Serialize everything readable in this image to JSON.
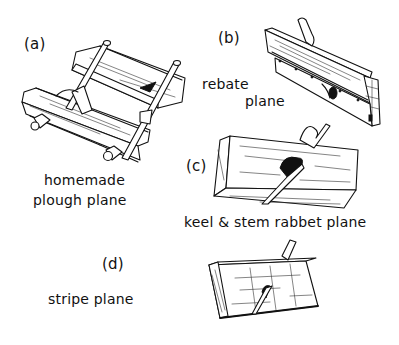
{
  "figure": {
    "items": [
      {
        "tag": "(a)",
        "caption_lines": [
          "homemade",
          "plough plane"
        ]
      },
      {
        "tag": "(b)",
        "caption_lines": [
          "rebate",
          "plane"
        ]
      },
      {
        "tag": "(c)",
        "caption_lines": [
          "keel & stem rabbet plane"
        ]
      },
      {
        "tag": "(d)",
        "caption_lines": [
          "stripe plane"
        ]
      }
    ]
  },
  "colors": {
    "ink": "#111111",
    "background": "#ffffff"
  }
}
